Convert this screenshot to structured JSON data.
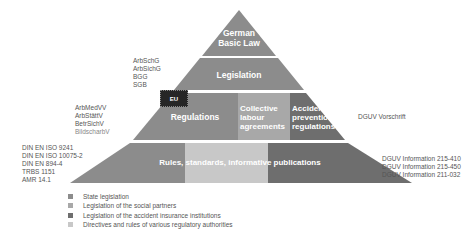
{
  "colors": {
    "state_legislation": "#8c8c8c",
    "social_partners": "#a8a8a8",
    "accident_insurance": "#6e6e6e",
    "regulatory_authorities": "#c8c8c8",
    "eu_badge": "#262626"
  },
  "pyramid": {
    "tier1": {
      "label_line1": "German",
      "label_line2": "Basic Law"
    },
    "tier2": {
      "label": "Legislation"
    },
    "tier3": {
      "regulations": "Regulations",
      "collective_line1": "Collective",
      "collective_line2": "labour",
      "collective_line3": "agreements",
      "accident_line1": "Accident",
      "accident_line2": "prevention",
      "accident_line3": "regulations",
      "eu_badge": "EU"
    },
    "tier4": {
      "label": "Rules, standards, informative publications"
    }
  },
  "side_labels": {
    "legislation": [
      "ArbSchG",
      "ArbSichG",
      "BGG",
      "SGB"
    ],
    "regulations": [
      "ArbMedVV",
      "ArbStättV",
      "BetrSichV",
      "BildscharbV"
    ],
    "rules": [
      "DIN EN ISO 9241",
      "DIN EN ISO 10075-2",
      "DIN EN 894-4",
      "TRBS 1151",
      "AMR 14.1"
    ],
    "accident_prevention": "DGUV Vorschrift",
    "publications": [
      "DGUV Information 215-410",
      "DGUV Information 215-450",
      "DGUV Information 211-032"
    ]
  },
  "legend": [
    {
      "label": "State legislation"
    },
    {
      "label": "Legislation of the social partners"
    },
    {
      "label": "Legislation of the accident insurance institutions"
    },
    {
      "label": "Directives and rules of various regulatory authorities"
    }
  ]
}
